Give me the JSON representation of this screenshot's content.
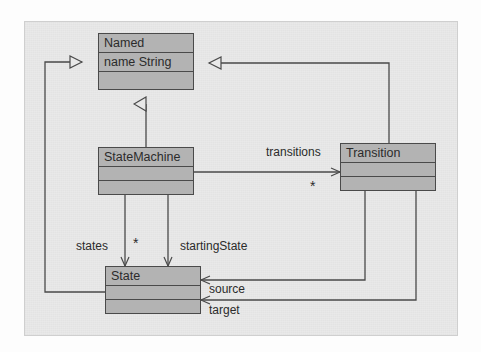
{
  "diagram": {
    "kind": "uml-class-diagram",
    "colors": {
      "paper": "#e9e9e9",
      "class_fill": "#b3b3b3",
      "line": "#4a4a4a",
      "text": "#2b2b2b"
    },
    "classes": [
      {
        "id": "named",
        "name": "Named",
        "attributes": [
          "name  String"
        ],
        "operations": [],
        "x": 98,
        "y": 33,
        "w": 96,
        "h": 57
      },
      {
        "id": "statemachine",
        "name": "StateMachine",
        "attributes": [],
        "operations": [],
        "x": 98,
        "y": 147,
        "w": 96,
        "h": 48
      },
      {
        "id": "transition",
        "name": "Transition",
        "attributes": [],
        "operations": [],
        "x": 340,
        "y": 143,
        "w": 96,
        "h": 48
      },
      {
        "id": "state",
        "name": "State",
        "attributes": [],
        "operations": [],
        "x": 105,
        "y": 266,
        "w": 96,
        "h": 48
      }
    ],
    "relations": [
      {
        "id": "statemachine-named",
        "type": "generalization",
        "from": "statemachine",
        "to": "named",
        "label": "",
        "multiplicity": ""
      },
      {
        "id": "state-named",
        "type": "generalization",
        "from": "state",
        "to": "named",
        "label": "",
        "multiplicity": ""
      },
      {
        "id": "transition-named",
        "type": "generalization",
        "from": "transition",
        "to": "named",
        "label": "",
        "multiplicity": ""
      },
      {
        "id": "statemachine-transitions",
        "type": "association",
        "from": "statemachine",
        "to": "transition",
        "label": "transitions",
        "multiplicity": "*"
      },
      {
        "id": "statemachine-states",
        "type": "association",
        "from": "statemachine",
        "to": "state",
        "label": "states",
        "multiplicity": "*"
      },
      {
        "id": "statemachine-startingstate",
        "type": "association",
        "from": "statemachine",
        "to": "state",
        "label": "startingState",
        "multiplicity": ""
      },
      {
        "id": "transition-source",
        "type": "association",
        "from": "transition",
        "to": "state",
        "label": "source",
        "multiplicity": ""
      },
      {
        "id": "transition-target",
        "type": "association",
        "from": "transition",
        "to": "state",
        "label": "target",
        "multiplicity": ""
      }
    ],
    "labels": {
      "transitions": "transitions",
      "transitions_mult": "*",
      "states": "states",
      "states_mult": "*",
      "starting_state": "startingState",
      "source": "source",
      "target": "target"
    }
  }
}
